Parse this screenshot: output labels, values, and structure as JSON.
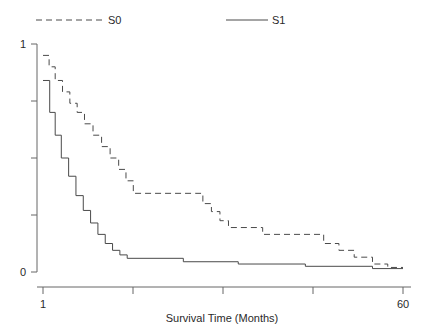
{
  "chart_data": {
    "type": "line",
    "title": "",
    "subtitle": "",
    "xlabel": "Survival Time (Months)",
    "ylabel": "",
    "xlim": [
      1,
      60
    ],
    "ylim": [
      0,
      1
    ],
    "grid": false,
    "legend_position": "top",
    "xticks": [
      1,
      60
    ],
    "xtick_labels": [
      "1",
      "60"
    ],
    "xticks_unlabeled": [
      15.8,
      30.6,
      45.3
    ],
    "yticks": [
      0,
      0.25,
      0.5,
      0.75,
      1
    ],
    "ytick_labels": [
      "0",
      "",
      "",
      "",
      "1"
    ],
    "series": [
      {
        "name": "S0",
        "style": "dashed",
        "color": "#4a4a4a",
        "points": [
          [
            1,
            0.95
          ],
          [
            2.0,
            0.95
          ],
          [
            2.0,
            0.9
          ],
          [
            3.0,
            0.9
          ],
          [
            3.0,
            0.84
          ],
          [
            4.2,
            0.84
          ],
          [
            4.2,
            0.79
          ],
          [
            5.4,
            0.79
          ],
          [
            5.4,
            0.74
          ],
          [
            6.6,
            0.74
          ],
          [
            6.6,
            0.7
          ],
          [
            7.8,
            0.7
          ],
          [
            7.8,
            0.65
          ],
          [
            9.2,
            0.65
          ],
          [
            9.2,
            0.6
          ],
          [
            10.6,
            0.6
          ],
          [
            10.6,
            0.55
          ],
          [
            12.0,
            0.55
          ],
          [
            12.0,
            0.5
          ],
          [
            13.4,
            0.5
          ],
          [
            13.4,
            0.45
          ],
          [
            14.6,
            0.45
          ],
          [
            14.6,
            0.4
          ],
          [
            15.8,
            0.4
          ],
          [
            15.8,
            0.345
          ],
          [
            26.0,
            0.345
          ],
          [
            26.0,
            0.345
          ],
          [
            27.2,
            0.345
          ],
          [
            27.2,
            0.3
          ],
          [
            28.6,
            0.3
          ],
          [
            28.6,
            0.265
          ],
          [
            30.0,
            0.265
          ],
          [
            30.0,
            0.225
          ],
          [
            31.4,
            0.225
          ],
          [
            31.4,
            0.195
          ],
          [
            37.0,
            0.195
          ],
          [
            37.0,
            0.165
          ],
          [
            47.0,
            0.165
          ],
          [
            47.0,
            0.125
          ],
          [
            49.5,
            0.125
          ],
          [
            49.5,
            0.095
          ],
          [
            52.0,
            0.095
          ],
          [
            52.0,
            0.065
          ],
          [
            55.0,
            0.065
          ],
          [
            55.0,
            0.035
          ],
          [
            57.5,
            0.035
          ],
          [
            57.5,
            0.02
          ],
          [
            60,
            0.02
          ]
        ]
      },
      {
        "name": "S1",
        "style": "solid",
        "color": "#4a4a4a",
        "points": [
          [
            1,
            0.84
          ],
          [
            2.1,
            0.84
          ],
          [
            2.1,
            0.7
          ],
          [
            3.0,
            0.7
          ],
          [
            3.0,
            0.6
          ],
          [
            4.0,
            0.6
          ],
          [
            4.0,
            0.5
          ],
          [
            5.2,
            0.5
          ],
          [
            5.2,
            0.42
          ],
          [
            6.4,
            0.42
          ],
          [
            6.4,
            0.335
          ],
          [
            7.6,
            0.335
          ],
          [
            7.6,
            0.27
          ],
          [
            8.8,
            0.27
          ],
          [
            8.8,
            0.215
          ],
          [
            10.0,
            0.215
          ],
          [
            10.0,
            0.165
          ],
          [
            11.2,
            0.165
          ],
          [
            11.2,
            0.125
          ],
          [
            12.4,
            0.125
          ],
          [
            12.4,
            0.095
          ],
          [
            13.6,
            0.095
          ],
          [
            13.6,
            0.075
          ],
          [
            14.8,
            0.075
          ],
          [
            14.8,
            0.06
          ],
          [
            24.0,
            0.06
          ],
          [
            24.0,
            0.045
          ],
          [
            33.0,
            0.045
          ],
          [
            33.0,
            0.035
          ],
          [
            44.0,
            0.035
          ],
          [
            44.0,
            0.025
          ],
          [
            55.0,
            0.025
          ],
          [
            55.0,
            0.015
          ],
          [
            60,
            0.015
          ]
        ]
      }
    ]
  },
  "legend": {
    "entries": [
      {
        "label": "S0",
        "style": "dashed"
      },
      {
        "label": "S1",
        "style": "solid"
      }
    ]
  },
  "axes": {
    "x_title": "Survival Time (Months)",
    "x_min_label": "1",
    "x_max_label": "60",
    "y_min_label": "0",
    "y_max_label": "1"
  },
  "colors": {
    "background": "#ffffff",
    "axis": "#555555",
    "line": "#4a4a4a",
    "text": "#2a2a2a"
  }
}
